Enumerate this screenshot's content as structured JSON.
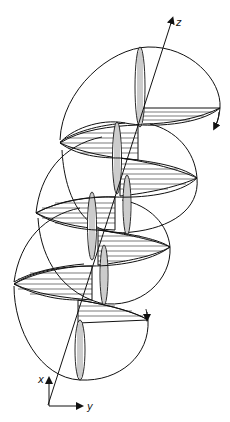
{
  "figure": {
    "axes": {
      "z_label": "z",
      "x_label": "x",
      "y_label": "y"
    },
    "colors": {
      "ink": "#111111",
      "background": "#ffffff"
    },
    "rotation_arrows": [
      {
        "name": "top-rotation-arrow",
        "position": "upper-right"
      },
      {
        "name": "lower-rotation-arrow",
        "position": "lower-right"
      }
    ]
  }
}
